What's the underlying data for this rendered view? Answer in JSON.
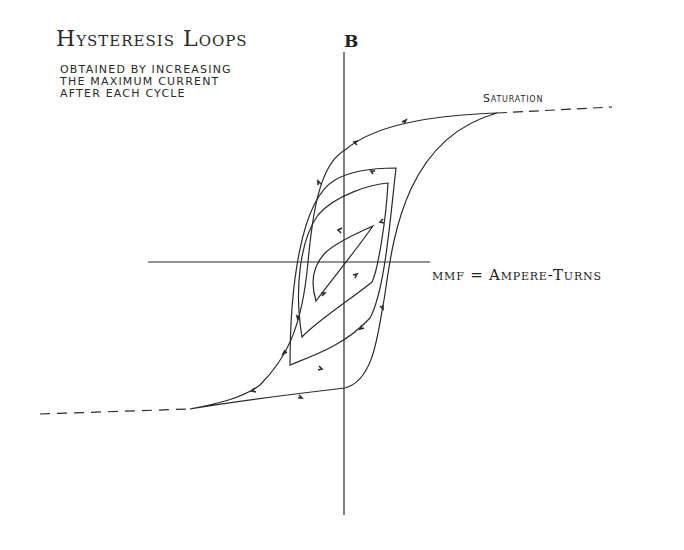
{
  "title": "Hysteresis Loops",
  "subtitle": "OBTAINED BY INCREASING\nTHE MAXIMUM CURRENT\nAFTER EACH CYCLE",
  "axes": {
    "y_label": "B",
    "x_label": "mmf = Ampere-Turns"
  },
  "annotations": {
    "saturation": "Saturation"
  },
  "colors": {
    "ink": "#2a2a2a",
    "background": "#ffffff"
  },
  "loops": [
    {
      "name": "loop-1-smallest",
      "peak": "small"
    },
    {
      "name": "loop-2",
      "peak": "medium"
    },
    {
      "name": "loop-3",
      "peak": "large"
    },
    {
      "name": "loop-4-outer-saturated",
      "peak": "saturation"
    }
  ]
}
